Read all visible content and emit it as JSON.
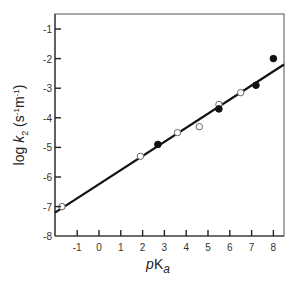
{
  "chart_data": {
    "type": "scatter",
    "title": "",
    "xlabel": "pKa",
    "xlabel_parts": {
      "p": "p",
      "K": "K",
      "sub": "a"
    },
    "ylabel": "log k2 (s-1m-1)",
    "ylabel_parts": {
      "log": "log ",
      "k": "k",
      "sub": "2",
      "units": " (s",
      "u1": "-1",
      "m": "m",
      "u2": "-1",
      "close": ")"
    },
    "xlim": [
      -1.8,
      8.7
    ],
    "ylim": [
      -8,
      -0.5
    ],
    "x_ticks": [
      -1,
      0,
      1,
      2,
      3,
      4,
      5,
      6,
      7,
      8
    ],
    "x_tick_labels": [
      "-1",
      "0",
      "1",
      "2",
      "3",
      "4",
      "5",
      "6",
      "7",
      "8"
    ],
    "y_ticks": [
      -1,
      -2,
      -3,
      -4,
      -5,
      -6,
      -7,
      -8
    ],
    "y_tick_labels": [
      "-1",
      "-2",
      "-3",
      "-4",
      "-5",
      "-6",
      "-7",
      "-8"
    ],
    "grid": false,
    "legend": null,
    "series": [
      {
        "name": "open circles",
        "marker": "open-circle",
        "points": [
          {
            "x": -1.7,
            "y": -7.0
          },
          {
            "x": 1.9,
            "y": -5.3
          },
          {
            "x": 3.6,
            "y": -4.5
          },
          {
            "x": 4.6,
            "y": -4.3
          },
          {
            "x": 5.5,
            "y": -3.55
          },
          {
            "x": 6.5,
            "y": -3.15
          }
        ]
      },
      {
        "name": "filled circles",
        "marker": "filled-circle",
        "points": [
          {
            "x": 2.7,
            "y": -4.9
          },
          {
            "x": 5.5,
            "y": -3.7
          },
          {
            "x": 7.2,
            "y": -2.9
          },
          {
            "x": 8.0,
            "y": -2.0
          }
        ]
      }
    ],
    "fit_line": {
      "type": "linear",
      "x_start": -1.8,
      "y_start": -7.1,
      "x_end": 8.7,
      "y_end": -2.2,
      "slope": 0.47
    }
  }
}
